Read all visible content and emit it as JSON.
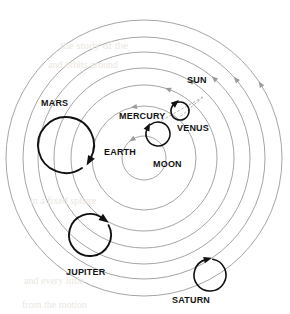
{
  "diagram": {
    "type": "astronomical-orbit-diagram",
    "width": 290,
    "height": 314,
    "background_color": "#ffffff",
    "center": {
      "x": 144,
      "y": 158
    }
  },
  "colors": {
    "orbit_ring": "#9b9b9b",
    "epicycle": "#111111",
    "planet_body": "#8c8c8c",
    "earth_body": "#9a9a9a",
    "earth_core": "#7b7b7b",
    "sun_body": "#a5a5a5",
    "label_text": "#141414",
    "dashed_link": "#b0b0b0",
    "ghost_text": "#ebe7e2"
  },
  "labels": {
    "sun": "SUN",
    "mars": "MARS",
    "mercury": "MERCURY",
    "venus": "VENUS",
    "earth": "EARTH",
    "moon": "MOON",
    "jupiter": "JUPITER",
    "saturn": "SATURN"
  },
  "label_positions": {
    "sun": {
      "x": 187,
      "y": 76,
      "size": 9
    },
    "mars": {
      "x": 41,
      "y": 99,
      "size": 9
    },
    "mercury": {
      "x": 119,
      "y": 112,
      "size": 9
    },
    "venus": {
      "x": 177,
      "y": 124,
      "size": 9
    },
    "earth": {
      "x": 104,
      "y": 148,
      "size": 9
    },
    "moon": {
      "x": 153,
      "y": 160,
      "size": 9
    },
    "jupiter": {
      "x": 66,
      "y": 268,
      "size": 9
    },
    "saturn": {
      "x": 172,
      "y": 296,
      "size": 9
    }
  },
  "chart_data": {
    "type": "scatter",
    "xlabel": "",
    "ylabel": "",
    "center_body": "EARTH",
    "orbit_rings": [
      {
        "name": "moon-orbit",
        "radius": 22,
        "arrow_angle_deg": 120
      },
      {
        "name": "sun-orbit",
        "radius": 52,
        "arrow_angle_deg": 100
      },
      {
        "name": "mars-orbit",
        "radius": 73,
        "arrow_angle_deg": 70
      },
      {
        "name": "ring-4",
        "radius": 90,
        "arrow_angle_deg": 58
      },
      {
        "name": "jupiter-orbit",
        "radius": 106,
        "arrow_angle_deg": 48
      },
      {
        "name": "ring-6",
        "radius": 121,
        "arrow_angle_deg": 40
      },
      {
        "name": "saturn-orbit",
        "radius": 138,
        "arrow_angle_deg": 32
      }
    ],
    "bodies": [
      {
        "name": "EARTH",
        "x": 144,
        "y": 158,
        "radius": 10,
        "kind": "earth"
      },
      {
        "name": "MOON",
        "x": 150,
        "y": 170,
        "radius": 3,
        "kind": "moon"
      },
      {
        "name": "SUN",
        "x": 203,
        "y": 97,
        "radius": 6,
        "kind": "sun"
      },
      {
        "name": "MERCURY",
        "x": 157,
        "y": 123,
        "radius": 4,
        "kind": "planet"
      },
      {
        "name": "VENUS",
        "x": 180,
        "y": 117,
        "radius": 4,
        "kind": "planet"
      },
      {
        "name": "MARS",
        "x": 66,
        "y": 117,
        "radius": 8,
        "kind": "planet"
      },
      {
        "name": "JUPITER",
        "x": 90,
        "y": 255,
        "radius": 8,
        "kind": "planet"
      },
      {
        "name": "SATURN",
        "x": 196,
        "y": 280,
        "radius": 8,
        "kind": "planet"
      }
    ],
    "epicycles": [
      {
        "name": "mercury-epicycle",
        "cx": 158,
        "cy": 134,
        "r": 12,
        "arrow_angle_deg": 128
      },
      {
        "name": "venus-epicycle",
        "cx": 180,
        "cy": 111,
        "r": 9,
        "arrow_angle_deg": 105
      },
      {
        "name": "mars-epicycle",
        "cx": 66,
        "cy": 145,
        "r": 28,
        "arrow_angle_deg": -55
      },
      {
        "name": "jupiter-epicycle",
        "cx": 90,
        "cy": 235,
        "r": 21,
        "arrow_angle_deg": 28
      },
      {
        "name": "saturn-epicycle",
        "cx": 210,
        "cy": 275,
        "r": 16,
        "arrow_angle_deg": 80
      }
    ],
    "sun_links": [
      {
        "from": "SUN",
        "to": "VENUS"
      },
      {
        "from": "SUN",
        "to": "MERCURY"
      }
    ]
  },
  "ghost_text": [
    {
      "text": "the  study  of  the",
      "x": 60,
      "y": 40,
      "size": 11
    },
    {
      "text": "and  orbits  around",
      "x": 48,
      "y": 60,
      "size": 10
    },
    {
      "text": "in  a  fixed  sphere",
      "x": 30,
      "y": 196,
      "size": 10
    },
    {
      "text": "and  every  little",
      "x": 24,
      "y": 276,
      "size": 10
    },
    {
      "text": "from  the  motion",
      "x": 22,
      "y": 300,
      "size": 10
    }
  ]
}
